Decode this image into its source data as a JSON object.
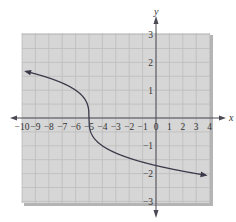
{
  "chart_data": {
    "type": "line",
    "title": "",
    "function": "y = -cbrt(x + 5)",
    "xlabel": "x",
    "ylabel": "y",
    "xlim": [
      -10,
      4
    ],
    "ylim": [
      -3,
      3
    ],
    "grid": true,
    "x_ticks": [
      "-10",
      "-9",
      "-8",
      "-7",
      "-6",
      "-5",
      "-4",
      "-3",
      "-2",
      "-1",
      "0",
      "1",
      "2",
      "3",
      "4"
    ],
    "y_ticks": [
      "3",
      "2",
      "1",
      "-1",
      "-2",
      "-3"
    ],
    "series": [
      {
        "name": "curve",
        "x": [
          -9.7,
          -9,
          -8,
          -7,
          -6,
          -5.5,
          -5.2,
          -5.05,
          -5,
          -4.95,
          -4.8,
          -4.5,
          -4,
          -3,
          -2,
          -1,
          0,
          1,
          2,
          3,
          3.7
        ],
        "y": [
          1.67,
          1.59,
          1.44,
          1.26,
          1.0,
          0.79,
          0.58,
          0.37,
          0,
          -0.37,
          -0.58,
          -0.79,
          -1.0,
          -1.26,
          -1.44,
          -1.59,
          -1.71,
          -1.82,
          -1.91,
          -2.0,
          -2.06
        ]
      }
    ],
    "arrows": "both ends",
    "colors": {
      "grid_bg": "#d6d6d6",
      "grid_line": "#bdbdbd",
      "curve": "#3a3a4a",
      "axis": "#4a4a55"
    }
  }
}
